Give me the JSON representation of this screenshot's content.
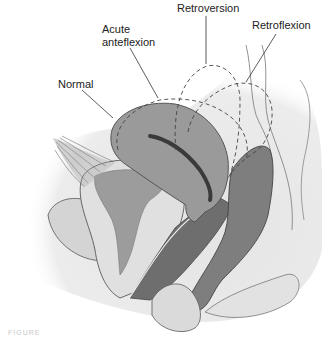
{
  "diagram": {
    "type": "anatomical-illustration",
    "labels": [
      {
        "id": "normal",
        "text": "Normal"
      },
      {
        "id": "acute_anteflexion",
        "text": "Acute\nanteflexion"
      },
      {
        "id": "retroversion",
        "text": "Retroversion"
      },
      {
        "id": "retroflexion",
        "text": "Retroflexion"
      }
    ],
    "caption": "FIGURE",
    "colors": {
      "background": "#ffffff",
      "soft_tissue": "#e6e6e6",
      "organ_light": "#d2d2d2",
      "uterus": "#9a9a9a",
      "dark_tissue": "#6e6e6e",
      "outline": "#555555",
      "dashed_outline": "#444444",
      "label_text": "#222222"
    }
  }
}
